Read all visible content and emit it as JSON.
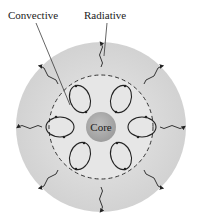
{
  "labels": {
    "convective": "Convective",
    "radiative": "Radiative",
    "core": "Core"
  },
  "colors": {
    "outer_zone": "#d6d6d6",
    "convective_zone": "#e4e4e4",
    "core": "#a9a9a9",
    "lines": "#222222"
  },
  "structure": {
    "zones": [
      "Core",
      "Convective",
      "Radiative"
    ],
    "convection_cells": 6,
    "radiative_arrows": 8
  }
}
